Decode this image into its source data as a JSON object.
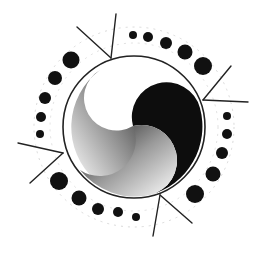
{
  "figure": {
    "background": "#ffffff",
    "ink": "#111111",
    "circle": {
      "cx": 134,
      "cy": 127,
      "r": 72
    },
    "dots": [
      {
        "cx": 133,
        "cy": 35,
        "r": 4
      },
      {
        "cx": 148,
        "cy": 37,
        "r": 5
      },
      {
        "cx": 166,
        "cy": 43,
        "r": 6
      },
      {
        "cx": 185,
        "cy": 52,
        "r": 7.5
      },
      {
        "cx": 203,
        "cy": 66,
        "r": 9
      },
      {
        "cx": 227,
        "cy": 116,
        "r": 4
      },
      {
        "cx": 227,
        "cy": 134,
        "r": 5
      },
      {
        "cx": 222,
        "cy": 153,
        "r": 6
      },
      {
        "cx": 213,
        "cy": 174,
        "r": 7.5
      },
      {
        "cx": 195,
        "cy": 194,
        "r": 9
      },
      {
        "cx": 136,
        "cy": 217,
        "r": 4
      },
      {
        "cx": 118,
        "cy": 212,
        "r": 5
      },
      {
        "cx": 98,
        "cy": 209,
        "r": 6
      },
      {
        "cx": 79,
        "cy": 198,
        "r": 7.5
      },
      {
        "cx": 59,
        "cy": 181,
        "r": 9
      },
      {
        "cx": 40,
        "cy": 134,
        "r": 4
      },
      {
        "cx": 41,
        "cy": 117,
        "r": 5
      },
      {
        "cx": 45,
        "cy": 98,
        "r": 6
      },
      {
        "cx": 55,
        "cy": 78,
        "r": 7
      },
      {
        "cx": 71,
        "cy": 60,
        "r": 8.5
      }
    ],
    "rays": [
      {
        "x1": 77,
        "y1": 27,
        "x2": 111,
        "y2": 58
      },
      {
        "x1": 116,
        "y1": 14,
        "x2": 111,
        "y2": 58
      },
      {
        "x1": 231,
        "y1": 66,
        "x2": 203,
        "y2": 100
      },
      {
        "x1": 248,
        "y1": 102,
        "x2": 203,
        "y2": 100
      },
      {
        "x1": 18,
        "y1": 143,
        "x2": 63,
        "y2": 153
      },
      {
        "x1": 30,
        "y1": 183,
        "x2": 63,
        "y2": 153
      },
      {
        "x1": 192,
        "y1": 223,
        "x2": 160,
        "y2": 195
      },
      {
        "x1": 153,
        "y1": 236,
        "x2": 160,
        "y2": 195
      }
    ]
  }
}
